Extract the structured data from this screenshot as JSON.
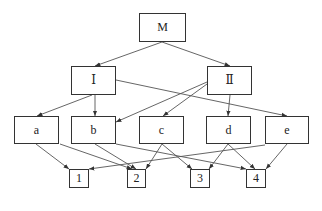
{
  "diagram": {
    "type": "hierarchy",
    "nodes": [
      {
        "id": "M",
        "label": "M",
        "level": 0,
        "x": 139,
        "y": 13,
        "w": 47,
        "h": 29
      },
      {
        "id": "I",
        "label": "Ⅰ",
        "level": 1,
        "x": 71,
        "y": 66,
        "w": 45,
        "h": 29
      },
      {
        "id": "II",
        "label": "Ⅱ",
        "level": 1,
        "x": 207,
        "y": 66,
        "w": 45,
        "h": 29
      },
      {
        "id": "a",
        "label": "a",
        "level": 2,
        "x": 14,
        "y": 116,
        "w": 45,
        "h": 28
      },
      {
        "id": "b",
        "label": "b",
        "level": 2,
        "x": 71,
        "y": 116,
        "w": 45,
        "h": 28
      },
      {
        "id": "c",
        "label": "c",
        "level": 2,
        "x": 139,
        "y": 116,
        "w": 45,
        "h": 28
      },
      {
        "id": "d",
        "label": "d",
        "level": 2,
        "x": 206,
        "y": 116,
        "w": 45,
        "h": 28
      },
      {
        "id": "e",
        "label": "e",
        "level": 2,
        "x": 265,
        "y": 116,
        "w": 44,
        "h": 28
      },
      {
        "id": "1",
        "label": "1",
        "level": 3,
        "x": 69,
        "y": 169,
        "w": 20,
        "h": 19
      },
      {
        "id": "2",
        "label": "2",
        "level": 3,
        "x": 127,
        "y": 169,
        "w": 19,
        "h": 19
      },
      {
        "id": "3",
        "label": "3",
        "level": 3,
        "x": 190,
        "y": 169,
        "w": 20,
        "h": 19
      },
      {
        "id": "4",
        "label": "4",
        "level": 3,
        "x": 246,
        "y": 169,
        "w": 20,
        "h": 19
      }
    ],
    "edges": [
      {
        "from": "M",
        "to": "I",
        "x1": 162,
        "y1": 42,
        "x2": 95,
        "y2": 66
      },
      {
        "from": "M",
        "to": "II",
        "x1": 162,
        "y1": 42,
        "x2": 230,
        "y2": 66
      },
      {
        "from": "I",
        "to": "a",
        "x1": 92,
        "y1": 95,
        "x2": 37,
        "y2": 116
      },
      {
        "from": "I",
        "to": "b",
        "x1": 95,
        "y1": 95,
        "x2": 95,
        "y2": 116
      },
      {
        "from": "I",
        "to": "e",
        "x1": 116,
        "y1": 80,
        "x2": 287,
        "y2": 116
      },
      {
        "from": "II",
        "to": "b",
        "x1": 207,
        "y1": 82,
        "x2": 116,
        "y2": 122
      },
      {
        "from": "II",
        "to": "c",
        "x1": 207,
        "y1": 84,
        "x2": 163,
        "y2": 116
      },
      {
        "from": "II",
        "to": "d",
        "x1": 230,
        "y1": 95,
        "x2": 228,
        "y2": 116
      },
      {
        "from": "a",
        "to": "1",
        "x1": 36,
        "y1": 144,
        "x2": 69,
        "y2": 169
      },
      {
        "from": "a",
        "to": "2",
        "x1": 60,
        "y1": 144,
        "x2": 132,
        "y2": 169
      },
      {
        "from": "b",
        "to": "2",
        "x1": 95,
        "y1": 144,
        "x2": 136,
        "y2": 169
      },
      {
        "from": "b",
        "to": "4",
        "x1": 116,
        "y1": 144,
        "x2": 246,
        "y2": 169
      },
      {
        "from": "c",
        "to": "2",
        "x1": 162,
        "y1": 144,
        "x2": 146,
        "y2": 169
      },
      {
        "from": "c",
        "to": "3",
        "x1": 162,
        "y1": 144,
        "x2": 192,
        "y2": 169
      },
      {
        "from": "d",
        "to": "3",
        "x1": 228,
        "y1": 144,
        "x2": 209,
        "y2": 169
      },
      {
        "from": "d",
        "to": "4",
        "x1": 228,
        "y1": 144,
        "x2": 255,
        "y2": 169
      },
      {
        "from": "e",
        "to": "1",
        "x1": 265,
        "y1": 145,
        "x2": 89,
        "y2": 169
      },
      {
        "from": "e",
        "to": "4",
        "x1": 287,
        "y1": 144,
        "x2": 266,
        "y2": 169
      }
    ],
    "colors": {
      "stroke": "#333333",
      "edge": "#555555",
      "background": "#ffffff"
    }
  }
}
